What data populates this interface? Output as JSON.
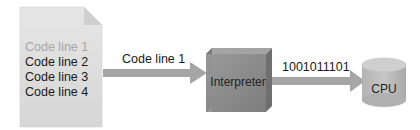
{
  "document": {
    "lines": [
      "Code line 1",
      "Code line 2",
      "Code line 3",
      "Code line 4"
    ],
    "active_line_color": "#a8a8a8",
    "text_color": "#1a1a1a"
  },
  "arrow1": {
    "label": "Code line 1"
  },
  "interpreter": {
    "label": "Interpreter",
    "color": "#8a8a8a"
  },
  "arrow2": {
    "label": "1001011101"
  },
  "cpu": {
    "label": "CPU",
    "color": "#bdbdbd"
  }
}
